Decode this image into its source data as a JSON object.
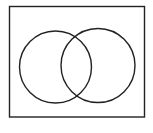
{
  "diagram": {
    "type": "venn",
    "stroke_color": "#222222",
    "background": "#ffffff",
    "universe": {
      "x": 9.5,
      "y": 6.5,
      "width": 135,
      "height": 110.5,
      "stroke_width": 1.4
    },
    "sets": [
      {
        "id": "A",
        "cx": 55.5,
        "cy": 67,
        "r": 36,
        "stroke_width": 1.4
      },
      {
        "id": "B",
        "cx": 98,
        "cy": 65.5,
        "r": 37,
        "stroke_width": 1.4
      }
    ]
  }
}
